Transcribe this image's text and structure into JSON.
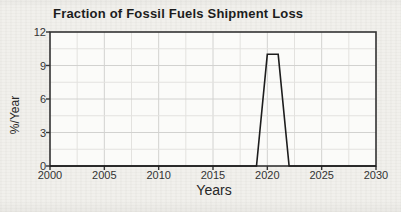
{
  "chart_data": {
    "type": "line",
    "title": "Fraction of Fossil Fuels Shipment Loss",
    "xlabel": "Years",
    "ylabel": "%/Year",
    "xlim": [
      2000,
      2030
    ],
    "ylim": [
      0,
      12
    ],
    "x_ticks": [
      2000,
      2005,
      2010,
      2015,
      2020,
      2025,
      2030
    ],
    "y_ticks": [
      0,
      3,
      6,
      9,
      12
    ],
    "x_minor_step": 2.5,
    "y_minor_step": 1.5,
    "grid": true,
    "legend": "none",
    "series": [
      {
        "name": "fossil-fuels-shipment-loss",
        "points": [
          [
            2000,
            0
          ],
          [
            2019,
            0
          ],
          [
            2020,
            10
          ],
          [
            2021,
            10
          ],
          [
            2022,
            0
          ],
          [
            2030,
            0
          ]
        ]
      }
    ],
    "colors": {
      "line": "#1d1d1d",
      "axis_border": "#333333",
      "grid_major": "#d2d2d0",
      "grid_minor": "#e3e2df",
      "plot_background": "#fbfbf9",
      "figure_background": "#f1f0ec",
      "text": "#262626"
    }
  }
}
